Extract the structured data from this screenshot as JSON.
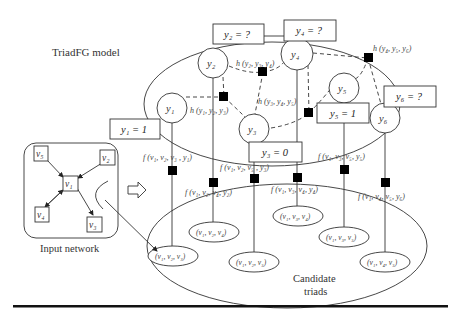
{
  "title": "TriadFG model",
  "input_network": {
    "label": "Input network",
    "nodes": [
      "v5",
      "v2",
      "v1",
      "v4",
      "v3"
    ],
    "node_labels": {
      "v1": "v₁",
      "v2": "v₂",
      "v3": "v₃",
      "v4": "v₄",
      "v5": "v₅"
    }
  },
  "candidate_label_line1": "Candidate",
  "candidate_label_line2": "triads",
  "variables": [
    {
      "id": "y1",
      "label": "y₁",
      "box": "y₁ = 1"
    },
    {
      "id": "y2",
      "label": "y₂",
      "box": "y₂ = ?"
    },
    {
      "id": "y3",
      "label": "y₃",
      "box": "y₃ = 0"
    },
    {
      "id": "y4",
      "label": "y₄",
      "box": "y₄ = ?"
    },
    {
      "id": "y5",
      "label": "y₅",
      "box": "y₅ = 1"
    },
    {
      "id": "y6",
      "label": "y₆",
      "box": "y₆ = ?"
    }
  ],
  "h_factors": [
    {
      "id": "h123",
      "label": "h (y₁, y₂, y₃)"
    },
    {
      "id": "h234",
      "label": "h (y₂, y₃, y₄)"
    },
    {
      "id": "h345",
      "label": "h (y₃, y₄, y₅)"
    },
    {
      "id": "h456",
      "label": "h (y₄, y₅, y₆)"
    }
  ],
  "f_factors": [
    {
      "id": "f1",
      "label": "f (v₁, v₂, v₃ , y₁)"
    },
    {
      "id": "f2",
      "label": "f (v₁, v₂, v₄, y₂)"
    },
    {
      "id": "f3",
      "label": "f (v₁, v₂, v₅ , y₃)"
    },
    {
      "id": "f4",
      "label": "f (v₁, v₃, v₄, y₄)"
    },
    {
      "id": "f5",
      "label": "f (v₁, v₃, v₅, y₅)"
    },
    {
      "id": "f6",
      "label": "f (v₁, v₄, v₅, y₆)"
    }
  ],
  "triads": [
    {
      "id": "t1",
      "label": "(v₁, v₂, v₃)"
    },
    {
      "id": "t2",
      "label": "(v₁, v₂, v₄)"
    },
    {
      "id": "t3",
      "label": "(v₁, v₂, v₅)"
    },
    {
      "id": "t4",
      "label": "(v₁, v₃, v₄)"
    },
    {
      "id": "t5",
      "label": "(v₁, v₃, v₅)"
    },
    {
      "id": "t6",
      "label": "(v₁, v₄, v₅)"
    }
  ],
  "arrow_symbol": "⇨"
}
